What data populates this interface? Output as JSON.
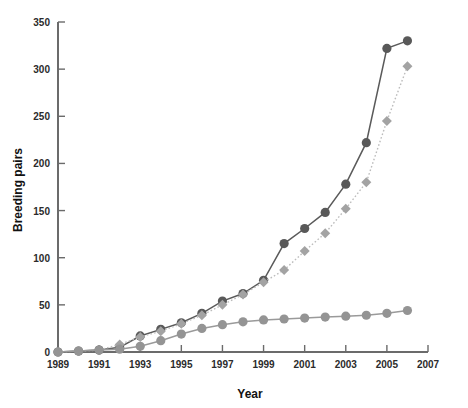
{
  "chart_data": {
    "type": "line",
    "title": "",
    "xlabel": "Year",
    "ylabel": "Breeding pairs",
    "xlim": [
      1989,
      2007
    ],
    "ylim": [
      0,
      350
    ],
    "xticks": [
      1989,
      1991,
      1993,
      1995,
      1997,
      1999,
      2001,
      2003,
      2005,
      2007
    ],
    "yticks": [
      0,
      50,
      100,
      150,
      200,
      250,
      300,
      350
    ],
    "grid": false,
    "legend": "none",
    "x": [
      1989,
      1990,
      1991,
      1992,
      1993,
      1994,
      1995,
      1996,
      1997,
      1998,
      1999,
      2000,
      2001,
      2002,
      2003,
      2004,
      2005,
      2006
    ],
    "series": [
      {
        "name": "dark-circles",
        "marker": "circle",
        "color": "#595959",
        "line_color": "#5a5a5a",
        "line_style": "solid",
        "values": [
          0,
          1,
          2,
          5,
          17,
          24,
          31,
          41,
          54,
          62,
          76,
          115,
          131,
          148,
          178,
          222,
          322,
          330
        ]
      },
      {
        "name": "light-diamonds",
        "marker": "diamond",
        "color": "#a3a3a3",
        "line_color": "#bcbcbc",
        "line_style": "dotted",
        "values": [
          0,
          1,
          2,
          8,
          16,
          22,
          30,
          39,
          50,
          61,
          74,
          87,
          107,
          126,
          152,
          180,
          245,
          303
        ]
      },
      {
        "name": "mid-grey-circles",
        "marker": "circle",
        "color": "#949494",
        "line_color": "#9a9a9a",
        "line_style": "solid",
        "values": [
          0,
          1,
          2,
          3,
          6,
          12,
          19,
          25,
          29,
          32,
          34,
          35,
          36,
          37,
          38,
          39,
          41,
          44
        ]
      }
    ]
  },
  "axes": {
    "y_label": "Breeding pairs",
    "x_label": "Year",
    "y_tick_labels": [
      "0",
      "50",
      "100",
      "150",
      "200",
      "250",
      "300",
      "350"
    ],
    "x_tick_labels": [
      "1989",
      "1991",
      "1993",
      "1995",
      "1997",
      "1999",
      "2001",
      "2003",
      "2005",
      "2007"
    ]
  },
  "colors": {
    "axis": "#6b6b6b",
    "text": "#111111",
    "series_dark": "#595959",
    "series_light": "#a3a3a3",
    "series_mid": "#949494",
    "background": "#ffffff"
  }
}
